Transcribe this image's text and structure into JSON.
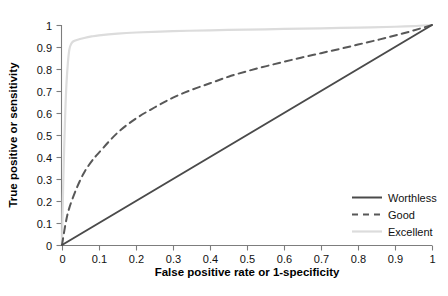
{
  "chart_data": {
    "type": "line",
    "title": "",
    "xlabel": "False positive rate or 1-specificity",
    "ylabel": "True positive or sensitivity",
    "xlim": [
      0,
      1
    ],
    "ylim": [
      0,
      1
    ],
    "grid": false,
    "legend_position": "lower-right",
    "xticks": [
      "0",
      "0.1",
      "0.2",
      "0.3",
      "0.4",
      "0.5",
      "0.6",
      "0.7",
      "0.8",
      "0.9",
      "1"
    ],
    "xtick_values": [
      0,
      0.1,
      0.2,
      0.3,
      0.4,
      0.5,
      0.6,
      0.7,
      0.8,
      0.9,
      1
    ],
    "yticks": [
      "0",
      "0.1",
      "0.2",
      "0.3",
      "0.4",
      "0.5",
      "0.6",
      "0.7",
      "0.8",
      "0.9",
      "1"
    ],
    "ytick_values": [
      0,
      0.1,
      0.2,
      0.3,
      0.4,
      0.5,
      0.6,
      0.7,
      0.8,
      0.9,
      1
    ],
    "series": [
      {
        "name": "Worthless",
        "style": "solid",
        "color": "#4a4a4a",
        "width": 2.0,
        "x": [
          0,
          0.1,
          0.2,
          0.3,
          0.4,
          0.5,
          0.6,
          0.7,
          0.8,
          0.9,
          1
        ],
        "values": [
          0,
          0.1,
          0.2,
          0.3,
          0.4,
          0.5,
          0.6,
          0.7,
          0.8,
          0.9,
          1
        ]
      },
      {
        "name": "Good",
        "style": "dashed",
        "color": "#585858",
        "width": 2.0,
        "x": [
          0,
          0.01,
          0.02,
          0.04,
          0.06,
          0.08,
          0.1,
          0.15,
          0.2,
          0.25,
          0.3,
          0.35,
          0.4,
          0.45,
          0.5,
          0.55,
          0.6,
          0.65,
          0.7,
          0.75,
          0.8,
          0.85,
          0.9,
          0.95,
          1
        ],
        "values": [
          0,
          0.1,
          0.17,
          0.26,
          0.33,
          0.38,
          0.42,
          0.51,
          0.575,
          0.625,
          0.67,
          0.705,
          0.735,
          0.765,
          0.79,
          0.812,
          0.833,
          0.853,
          0.872,
          0.891,
          0.911,
          0.931,
          0.952,
          0.975,
          1
        ]
      },
      {
        "name": "Excellent",
        "style": "solid",
        "color": "#dcdcdc",
        "width": 2.2,
        "x": [
          0,
          0.003,
          0.006,
          0.009,
          0.012,
          0.016,
          0.02,
          0.025,
          0.03,
          0.04,
          0.06,
          0.08,
          0.1,
          0.15,
          0.2,
          0.3,
          0.4,
          0.5,
          0.6,
          0.7,
          0.8,
          0.9,
          0.95,
          1
        ],
        "values": [
          0,
          0.26,
          0.45,
          0.61,
          0.73,
          0.83,
          0.89,
          0.915,
          0.925,
          0.932,
          0.941,
          0.948,
          0.953,
          0.961,
          0.966,
          0.972,
          0.976,
          0.979,
          0.982,
          0.985,
          0.988,
          0.992,
          0.995,
          1
        ]
      }
    ]
  },
  "legend": {
    "entries": [
      {
        "label": "Worthless"
      },
      {
        "label": "Good"
      },
      {
        "label": "Excellent"
      }
    ]
  },
  "colors": {
    "worthless": "#4a4a4a",
    "good": "#585858",
    "excellent": "#dcdcdc",
    "axis": "#7d7d7d",
    "text": "#111111",
    "background": "#ffffff"
  }
}
